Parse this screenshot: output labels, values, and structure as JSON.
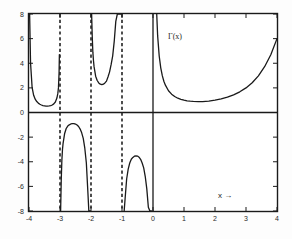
{
  "figure": {
    "background_color": "#fdfdfd",
    "axis_color": "#1a1a1a",
    "curve_color": "#1a1a1a",
    "asymptote_color": "#222222",
    "gamma_label": "Γ(x)",
    "xaxis_annotation": "x →"
  },
  "chart_data": {
    "type": "line",
    "title": "",
    "subtitle": "",
    "xlabel": "x →",
    "ylabel": "",
    "xlim": [
      -4,
      4
    ],
    "ylim": [
      -8,
      8
    ],
    "grid": false,
    "legend": null,
    "annotations": [
      {
        "text": "Γ(x)",
        "x": 1.1,
        "y": 6.2
      },
      {
        "text": "x →",
        "x": 2.6,
        "y": -6.9
      }
    ],
    "xticks": [
      -4,
      -3,
      -2,
      -1,
      0,
      1,
      2,
      3,
      4
    ],
    "xtick_labels": [
      "-4",
      "-3",
      "-2",
      "-1",
      "0",
      "1",
      "2",
      "3",
      "4"
    ],
    "yticks": [
      -8,
      -6,
      -4,
      -2,
      0,
      2,
      4,
      6,
      8
    ],
    "ytick_labels": [
      "-8",
      "-6",
      "-4",
      "-2",
      "0",
      "2",
      "4",
      "6",
      "8"
    ],
    "asymptotes": [
      -3,
      -2,
      -1
    ],
    "asymptote_style": "dashed",
    "axis_lines": [
      {
        "orientation": "vertical",
        "value": 0
      },
      {
        "orientation": "horizontal",
        "value": 0
      }
    ],
    "series": [
      {
        "name": "Γ(x) branch (-4,-3)",
        "x": [
          -3.98,
          -3.95,
          -3.9,
          -3.85,
          -3.8,
          -3.75,
          -3.7,
          -3.65,
          -3.6,
          -3.55,
          -3.5,
          -3.45,
          -3.4,
          -3.35,
          -3.3,
          -3.25,
          -3.2,
          -3.15,
          -3.1,
          -3.07,
          -3.05,
          -3.03,
          -3.02
        ],
        "y": [
          8.0,
          4.02,
          2.05,
          1.4,
          1.08,
          0.89,
          0.76,
          0.67,
          0.61,
          0.56,
          0.54,
          0.52,
          0.52,
          0.53,
          0.56,
          0.61,
          0.7,
          0.85,
          1.17,
          1.55,
          2.0,
          3.2,
          4.7
        ]
      },
      {
        "name": "Γ(x) branch (-3,-2)",
        "x": [
          -2.98,
          -2.96,
          -2.94,
          -2.92,
          -2.9,
          -2.85,
          -2.8,
          -2.75,
          -2.7,
          -2.65,
          -2.6,
          -2.55,
          -2.5,
          -2.45,
          -2.4,
          -2.35,
          -2.3,
          -2.25,
          -2.2,
          -2.15,
          -2.1,
          -2.07,
          -2.05,
          -2.03,
          -2.02
        ],
        "y": [
          -8.0,
          -5.5,
          -3.9,
          -3.0,
          -2.5,
          -1.7,
          -1.3,
          -1.1,
          -1.0,
          -0.93,
          -0.9,
          -0.9,
          -0.94,
          -1.02,
          -1.14,
          -1.35,
          -1.65,
          -2.1,
          -2.9,
          -4.1,
          -6.5,
          -8.0,
          -8.0,
          -8.0,
          -8.0
        ]
      },
      {
        "name": "Γ(x) branch (-2,-1)",
        "x": [
          -1.98,
          -1.96,
          -1.94,
          -1.92,
          -1.9,
          -1.85,
          -1.8,
          -1.75,
          -1.7,
          -1.65,
          -1.6,
          -1.55,
          -1.5,
          -1.45,
          -1.4,
          -1.35,
          -1.3,
          -1.25,
          -1.2,
          -1.15,
          -1.1,
          -1.07,
          -1.05,
          -1.03
        ],
        "y": [
          8.0,
          6.2,
          4.9,
          4.2,
          3.7,
          2.95,
          2.6,
          2.4,
          2.3,
          2.26,
          2.3,
          2.4,
          2.55,
          2.9,
          3.3,
          3.9,
          4.6,
          5.8,
          7.4,
          8.0,
          8.0,
          8.0,
          8.0,
          8.0
        ]
      },
      {
        "name": "Γ(x) branch (-1,0)",
        "x": [
          -0.93,
          -0.9,
          -0.85,
          -0.8,
          -0.75,
          -0.7,
          -0.65,
          -0.6,
          -0.55,
          -0.5,
          -0.45,
          -0.4,
          -0.35,
          -0.3,
          -0.25,
          -0.2,
          -0.15,
          -0.1,
          -0.07,
          -0.05
        ],
        "y": [
          -8.0,
          -7.0,
          -5.4,
          -4.6,
          -4.1,
          -3.8,
          -3.65,
          -3.55,
          -3.52,
          -3.54,
          -3.63,
          -3.8,
          -4.1,
          -4.5,
          -5.2,
          -6.2,
          -7.7,
          -8.0,
          -8.0,
          -8.0
        ]
      },
      {
        "name": "Γ(x) branch (0,4)",
        "x": [
          0.12,
          0.15,
          0.2,
          0.25,
          0.3,
          0.35,
          0.4,
          0.5,
          0.6,
          0.7,
          0.8,
          0.9,
          1.0,
          1.1,
          1.2,
          1.3,
          1.46,
          1.6,
          1.8,
          2.0,
          2.2,
          2.4,
          2.6,
          2.8,
          3.0,
          3.2,
          3.4,
          3.6,
          3.8,
          4.0
        ],
        "y": [
          8.0,
          6.22,
          4.59,
          3.63,
          2.99,
          2.54,
          2.22,
          1.77,
          1.49,
          1.3,
          1.16,
          1.07,
          1.0,
          0.95,
          0.92,
          0.9,
          0.886,
          0.89,
          0.93,
          1.0,
          1.1,
          1.24,
          1.43,
          1.68,
          2.0,
          2.42,
          2.98,
          3.72,
          4.69,
          6.0
        ]
      }
    ]
  },
  "axis_labels": {
    "x": [
      "-4",
      "-3",
      "-2",
      "-1",
      "0",
      "1",
      "2",
      "3",
      "4"
    ],
    "y": [
      "8",
      "6",
      "4",
      "2",
      "0",
      "-2",
      "-4",
      "-6",
      "-8"
    ]
  }
}
